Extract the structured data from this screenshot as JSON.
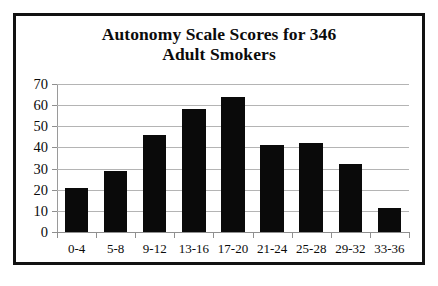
{
  "figure": {
    "title_line1": "Autonomy Scale Scores for 346",
    "title_line2": "Adult Smokers",
    "border_color": "#111111",
    "background_color": "#ffffff"
  },
  "chart_data": {
    "type": "bar",
    "title": "Autonomy Scale Scores for 346 Adult Smokers",
    "xlabel": "",
    "ylabel": "",
    "categories": [
      "0-4",
      "5-8",
      "9-12",
      "13-16",
      "17-20",
      "21-24",
      "25-28",
      "29-32",
      "33-36"
    ],
    "values": [
      21,
      29,
      46,
      58,
      64,
      41,
      42,
      32,
      11.5
    ],
    "ylim": [
      0,
      70
    ],
    "yticks": [
      0,
      10,
      20,
      30,
      40,
      50,
      60,
      70
    ],
    "ytick_labels": [
      "0",
      "10",
      "20",
      "30",
      "40",
      "50",
      "60",
      "70"
    ],
    "grid": true,
    "grid_axis": "y",
    "grid_color": "#b4b4b4",
    "bar_color": "#0a0a0a",
    "legend": null,
    "legend_position": "none"
  }
}
